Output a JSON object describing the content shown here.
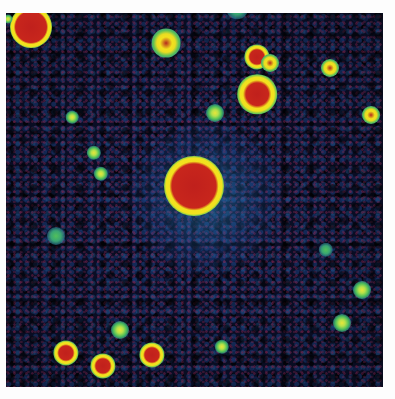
{
  "image": {
    "description": "False-color astronomical deep-field image with a bright central source and scattered point sources over a noisy background",
    "caption_fragment": "",
    "colormap": {
      "background_dark": "#0b0f2a",
      "noise_blue": "#1e468c",
      "noise_magenta": "#96285a",
      "contour_cyan": "#2f9b8c",
      "contour_green": "#58c25a",
      "contour_yellow": "#f2e11e",
      "core_red": "#c8261c"
    },
    "sources": [
      {
        "id": "central",
        "type": "big",
        "x": 194,
        "y": 186,
        "size": 40
      },
      {
        "id": "top-left",
        "type": "big",
        "x": 31,
        "y": 27,
        "size": 28
      },
      {
        "id": "right-upper",
        "type": "med",
        "x": 257,
        "y": 94,
        "size": 22
      },
      {
        "id": "upper-pair-a",
        "type": "med",
        "x": 257,
        "y": 57,
        "size": 14
      },
      {
        "id": "upper-pair-b",
        "type": "small",
        "x": 270,
        "y": 63,
        "size": 10
      },
      {
        "id": "upper-mid",
        "type": "small",
        "x": 166,
        "y": 43,
        "size": 16
      },
      {
        "id": "right-mid",
        "type": "small",
        "x": 330,
        "y": 68,
        "size": 10
      },
      {
        "id": "right-edge",
        "type": "small",
        "x": 371,
        "y": 115,
        "size": 10
      },
      {
        "id": "bottom-a",
        "type": "med",
        "x": 66,
        "y": 353,
        "size": 14
      },
      {
        "id": "bottom-b",
        "type": "med",
        "x": 103,
        "y": 366,
        "size": 14
      },
      {
        "id": "bottom-c",
        "type": "med",
        "x": 152,
        "y": 355,
        "size": 14
      },
      {
        "id": "bottom-d",
        "type": "faint",
        "x": 120,
        "y": 330,
        "size": 10
      },
      {
        "id": "right-low",
        "type": "faint",
        "x": 362,
        "y": 290,
        "size": 10
      },
      {
        "id": "right-lower",
        "type": "faint",
        "x": 342,
        "y": 323,
        "size": 10
      },
      {
        "id": "mid-upper",
        "type": "faint",
        "x": 215,
        "y": 113,
        "size": 10
      },
      {
        "id": "left-a",
        "type": "faint",
        "x": 94,
        "y": 153,
        "size": 8
      },
      {
        "id": "left-b",
        "type": "faint",
        "x": 72,
        "y": 117,
        "size": 7
      },
      {
        "id": "left-c",
        "type": "faint",
        "x": 101,
        "y": 174,
        "size": 8
      },
      {
        "id": "left-low",
        "type": "blob",
        "x": 56,
        "y": 236,
        "size": 10
      },
      {
        "id": "bottom-mid",
        "type": "faint",
        "x": 222,
        "y": 347,
        "size": 8
      },
      {
        "id": "top-edge-a",
        "type": "faint",
        "x": 208,
        "y": 2,
        "size": 6
      },
      {
        "id": "top-edge-b",
        "type": "blob",
        "x": 237,
        "y": 8,
        "size": 12
      },
      {
        "id": "right-faint",
        "type": "blob",
        "x": 326,
        "y": 250,
        "size": 8
      },
      {
        "id": "tiny-top-left",
        "type": "faint",
        "x": 8,
        "y": 19,
        "size": 5
      }
    ]
  }
}
